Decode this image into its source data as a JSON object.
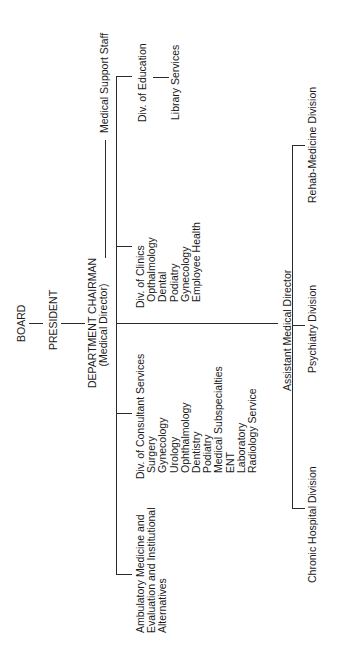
{
  "chart": {
    "orientation": "rotated-90-counterclockwise",
    "board": "BOARD",
    "president": "PRESIDENT",
    "chairman": {
      "title": "DEPARTMENT CHAIRMAN",
      "subtitle": "(Medical Director)"
    },
    "medical_support_staff": "Medical Support Staff",
    "div_education": {
      "title": "Div. of Education",
      "child": "Library Services"
    },
    "div_clinics": {
      "title": "Div. of Clinics",
      "items": [
        "Opthalmology",
        "Dental",
        "Podiatry",
        "Gynecology",
        "Employee Health"
      ]
    },
    "div_consultant": {
      "title": "Div. of Consultant Services",
      "items": [
        "Surgery",
        "Gynecology",
        "Urology",
        "Ophthalmology",
        "Dentistry",
        "Podiatry",
        "Medical Subspecialties",
        "ENT",
        "Laboratory",
        "Radiology Service"
      ]
    },
    "ambulatory": {
      "lines": [
        "Ambulatory Medicine and",
        "Evaluation and Institutional",
        "Alternatives"
      ]
    },
    "assistant_director": "Assistant Medical Director",
    "divisions": {
      "rehab": "Rehab-Medicine Division",
      "psychiatry": "Psychiatry Division",
      "chronic": "Chronic Hospital Division"
    }
  }
}
